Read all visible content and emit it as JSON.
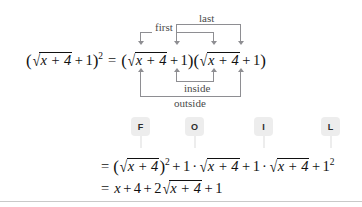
{
  "figure": {
    "type": "algebra-foil-expansion-diagram",
    "colors": {
      "ink": "#111111",
      "connector": "#8e8e92",
      "label": "#4a4a4a",
      "chip_bg": "#ededed",
      "rule": "#c9c9c9",
      "page_bg": "#ffffff"
    }
  },
  "main_equation": {
    "lhs": {
      "open_paren": "(",
      "radical_sign": "√",
      "radicand": "x + 4",
      "plus": "+",
      "one": "1",
      "close_paren": ")",
      "exponent": "2"
    },
    "equals": "=",
    "factor1": {
      "open_paren": "(",
      "radical_sign": "√",
      "radicand": "x + 4",
      "plus": "+",
      "one": "1",
      "close_paren": ")"
    },
    "factor2": {
      "open_paren": "(",
      "radical_sign": "√",
      "radicand": "x + 4",
      "plus": "+",
      "one": "1",
      "close_paren": ")"
    }
  },
  "connectors": {
    "first": "first",
    "outside": "outside",
    "inside": "inside",
    "last": "last"
  },
  "foil_chips": [
    {
      "letter": "F",
      "meaning": "first"
    },
    {
      "letter": "O",
      "meaning": "outside"
    },
    {
      "letter": "I",
      "meaning": "inside"
    },
    {
      "letter": "L",
      "meaning": "last"
    }
  ],
  "expansion_line": {
    "equals": "=",
    "term1": {
      "open_paren": "(",
      "radical_sign": "√",
      "radicand": "x + 4",
      "close_paren": ")",
      "exponent": "2"
    },
    "plus1": "+",
    "term2": {
      "coefficient": "1",
      "dot": "·",
      "radical_sign": "√",
      "radicand": "x + 4"
    },
    "plus2": "+",
    "term3": {
      "coefficient": "1",
      "dot": "·",
      "radical_sign": "√",
      "radicand": "x + 4"
    },
    "plus3": "+",
    "term4": {
      "base": "1",
      "exponent": "2"
    }
  },
  "result_line": {
    "equals": "=",
    "x": "x",
    "plus1": "+",
    "four": "4",
    "plus2": "+",
    "coefficient": "2",
    "radical_sign": "√",
    "radicand": "x + 4",
    "plus3": "+",
    "one": "1"
  }
}
